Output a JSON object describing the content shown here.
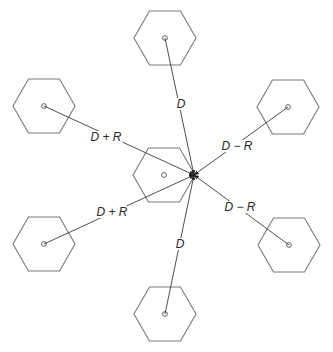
{
  "diagram": {
    "colors": {
      "hex_stroke": "#7a7a7a",
      "line": "#3a3a3a",
      "background": "#ffffff"
    },
    "hex_radius": 31,
    "target": {
      "x": 194,
      "y": 175
    },
    "center_cell": {
      "cx": 164,
      "cy": 175
    },
    "cells": [
      {
        "id": "top",
        "cx": 165,
        "cy": 38
      },
      {
        "id": "upper-left",
        "cx": 44,
        "cy": 106
      },
      {
        "id": "upper-right",
        "cx": 288,
        "cy": 107
      },
      {
        "id": "lower-left",
        "cx": 44,
        "cy": 244
      },
      {
        "id": "lower-right",
        "cx": 289,
        "cy": 245
      },
      {
        "id": "bottom",
        "cx": 165,
        "cy": 314
      }
    ],
    "labels": [
      {
        "id": "top",
        "text": "D",
        "x": 181,
        "y": 104
      },
      {
        "id": "upper-left",
        "text": "D + R",
        "x": 106,
        "y": 137
      },
      {
        "id": "upper-right",
        "text": "D − R",
        "x": 237,
        "y": 146
      },
      {
        "id": "lower-left",
        "text": "D + R",
        "x": 112,
        "y": 212
      },
      {
        "id": "lower-right",
        "text": "D − R",
        "x": 240,
        "y": 207
      },
      {
        "id": "bottom",
        "text": "D",
        "x": 180,
        "y": 244
      }
    ]
  }
}
